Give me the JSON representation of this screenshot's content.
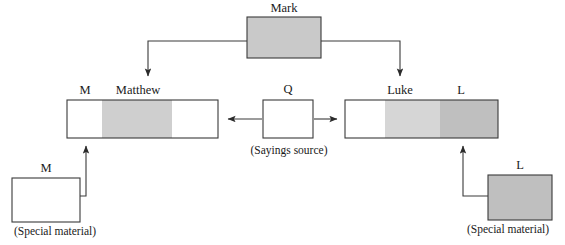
{
  "diagram": {
    "type": "source-relationship-diagram",
    "colors": {
      "stroke": "#3a3a3a",
      "text": "#1a1a1a",
      "mark_fill": "#c9c9c9",
      "triple_tradition_fill": "#cfcfcf",
      "q_material_fill": "#d6d6d6",
      "special_material_fill": "#bfbfbf",
      "white_fill": "#ffffff",
      "background": "#ffffff"
    },
    "nodes": {
      "mark": {
        "label": "Mark",
        "caption": "",
        "fill": "mark_fill",
        "x": 247,
        "y": 17,
        "w": 74,
        "h": 41
      },
      "matthew": {
        "label": "Matthew",
        "left_label": "M",
        "caption": "",
        "x": 67,
        "y": 100,
        "w": 151,
        "h": 38,
        "segments": [
          {
            "name": "matthew-special-M",
            "fill": "white_fill",
            "start": 0,
            "end": 35
          },
          {
            "name": "matthew-markan-triple-tradition",
            "fill": "triple_tradition_fill",
            "start": 35,
            "end": 105
          },
          {
            "name": "matthew-q-material",
            "fill": "white_fill",
            "start": 105,
            "end": 151
          }
        ]
      },
      "q": {
        "label": "Q",
        "caption": "(Sayings source)",
        "fill": "white_fill",
        "x": 263,
        "y": 100,
        "w": 50,
        "h": 38
      },
      "luke": {
        "label": "Luke",
        "right_label": "L",
        "caption": "",
        "x": 345,
        "y": 100,
        "w": 153,
        "h": 38,
        "segments": [
          {
            "name": "luke-markan-material",
            "fill": "white_fill",
            "start": 0,
            "end": 40
          },
          {
            "name": "luke-triple-tradition",
            "fill": "triple_tradition_fill",
            "start": 40,
            "end": 95
          },
          {
            "name": "luke-special-L",
            "fill": "special_material_fill",
            "start": 95,
            "end": 153
          }
        ]
      },
      "m_source": {
        "label": "M",
        "caption": "(Special material)",
        "fill": "white_fill",
        "x": 12,
        "y": 178,
        "w": 68,
        "h": 44
      },
      "l_source": {
        "label": "L",
        "caption": "(Special material)",
        "fill": "special_material_fill",
        "x": 488,
        "y": 175,
        "w": 64,
        "h": 45
      }
    },
    "edges": [
      {
        "name": "mark-to-matthew",
        "from": "mark",
        "to": "matthew",
        "style": "elbow-down-left",
        "arrow": true
      },
      {
        "name": "mark-to-luke",
        "from": "mark",
        "to": "luke",
        "style": "elbow-down-right",
        "arrow": true
      },
      {
        "name": "q-to-matthew",
        "from": "q",
        "to": "matthew",
        "style": "straight-left",
        "arrow": true
      },
      {
        "name": "q-to-luke",
        "from": "q",
        "to": "luke",
        "style": "straight-right",
        "arrow": true
      },
      {
        "name": "m-source-to-matthew",
        "from": "m_source",
        "to": "matthew",
        "style": "elbow-up-right",
        "arrow": true
      },
      {
        "name": "l-source-to-luke",
        "from": "l_source",
        "to": "luke",
        "style": "elbow-up-left",
        "arrow": true
      }
    ],
    "labels": {
      "mark": "Mark",
      "matthew": "Matthew",
      "matthew_m": "M",
      "q": "Q",
      "q_caption": "(Sayings source)",
      "luke": "Luke",
      "luke_l": "L",
      "m_source": "M",
      "m_source_caption": "(Special material)",
      "l_source": "L",
      "l_source_caption": "(Special material)"
    }
  }
}
